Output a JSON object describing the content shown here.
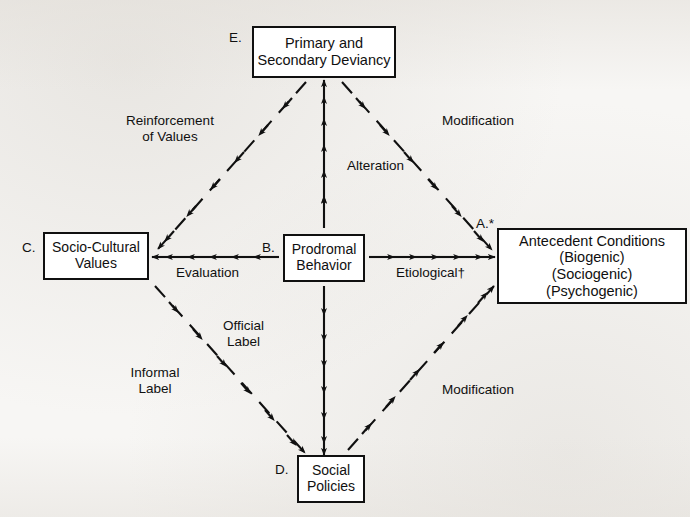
{
  "figure": {
    "nodes": [
      {
        "id": "deviancy",
        "key": "E.",
        "lines": [
          "Primary and",
          "Secondary Deviancy"
        ]
      },
      {
        "id": "values",
        "key": "C.",
        "lines": [
          "Socio-Cultural",
          "Values"
        ]
      },
      {
        "id": "prodromal",
        "key": "B.",
        "lines": [
          "Prodromal",
          "Behavior"
        ]
      },
      {
        "id": "antecedent",
        "key": "A.*",
        "lines": [
          "Antecedent Conditions",
          "(Biogenic)",
          "(Sociogenic)",
          "(Psychogenic)"
        ]
      },
      {
        "id": "policies",
        "key": "D.",
        "lines": [
          "Social",
          "Policies"
        ]
      }
    ],
    "edge_labels": [
      {
        "id": "alteration",
        "lines": [
          "Alteration"
        ]
      },
      {
        "id": "evaluation",
        "lines": [
          "Evaluation"
        ]
      },
      {
        "id": "etiological",
        "lines": [
          "Etiological†"
        ]
      },
      {
        "id": "official",
        "lines": [
          "Official",
          "Label"
        ]
      }
    ],
    "region_labels": [
      {
        "id": "reinforcement",
        "lines": [
          "Reinforcement",
          "of Values"
        ]
      },
      {
        "id": "modification_top",
        "lines": [
          "Modification"
        ]
      },
      {
        "id": "informal",
        "lines": [
          "Informal",
          "Label"
        ]
      },
      {
        "id": "modification_bottom",
        "lines": [
          "Modification"
        ]
      }
    ],
    "colors": {
      "ink": "#101010",
      "paper": "#f7f6f4",
      "node_fill": "#ffffff"
    },
    "edges": [
      {
        "from": "prodromal",
        "to": "deviancy",
        "style": "dashed",
        "direction": "up"
      },
      {
        "from": "prodromal",
        "to": "policies",
        "style": "dashed",
        "direction": "down"
      },
      {
        "from": "prodromal",
        "to": "values",
        "style": "dashed",
        "direction": "left"
      },
      {
        "from": "prodromal",
        "to": "antecedent",
        "style": "dashed",
        "direction": "right"
      },
      {
        "from": "deviancy",
        "to": "values",
        "style": "dashed",
        "direction": "down-left"
      },
      {
        "from": "deviancy",
        "to": "antecedent",
        "style": "dashed",
        "direction": "down-right"
      },
      {
        "from": "values",
        "to": "policies",
        "style": "dashed",
        "direction": "down-right"
      },
      {
        "from": "policies",
        "to": "antecedent",
        "style": "dashed",
        "direction": "up-right"
      }
    ]
  }
}
